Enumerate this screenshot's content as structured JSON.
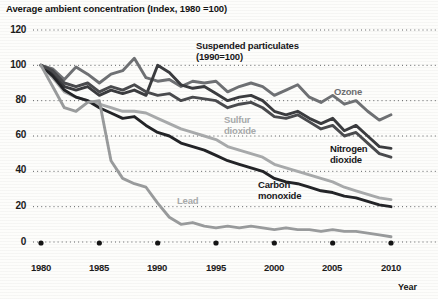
{
  "chart_data": {
    "type": "line",
    "title": "Average ambient concentration (Index, 1980 =100)",
    "xlabel": "Year",
    "ylabel": "",
    "xlim": [
      1980,
      2010
    ],
    "ylim": [
      0,
      120
    ],
    "grid": true,
    "grid_style": "dotted-horizontal",
    "legend": "inline-annotations",
    "xticks": [
      "1980",
      "1985",
      "1990",
      "1995",
      "2000",
      "2005",
      "2010"
    ],
    "yticks": [
      "0",
      "20",
      "40",
      "60",
      "80",
      "100",
      "120"
    ],
    "x": [
      1980,
      1981,
      1982,
      1983,
      1984,
      1985,
      1986,
      1987,
      1988,
      1989,
      1990,
      1991,
      1992,
      1993,
      1994,
      1995,
      1996,
      1997,
      1998,
      1999,
      2000,
      2001,
      2002,
      2003,
      2004,
      2005,
      2006,
      2007,
      2008,
      2009,
      2010
    ],
    "series": [
      {
        "name": "Ozone",
        "color": "#6f7174",
        "label_text": "Ozone",
        "values": [
          100,
          98,
          92,
          99,
          95,
          90,
          95,
          97,
          104,
          93,
          91,
          92,
          88,
          91,
          90,
          91,
          85,
          88,
          90,
          88,
          83,
          86,
          89,
          82,
          79,
          83,
          78,
          80,
          74,
          69,
          72
        ]
      },
      {
        "name": "Suspended particulates (1990=100)",
        "color": "#3b3c3f",
        "label_text": "Suspended particulates\n(1990=100)",
        "values": [
          100,
          96,
          88,
          86,
          88,
          83,
          86,
          84,
          86,
          83,
          100,
          96,
          89,
          87,
          88,
          84,
          80,
          82,
          83,
          80,
          74,
          72,
          74,
          70,
          67,
          70,
          63,
          66,
          60,
          54,
          53
        ]
      },
      {
        "name": "Sulfur dioxide",
        "color": "#a9abac",
        "label_text": "Sulfur\ndioxide",
        "values": [
          100,
          93,
          85,
          82,
          80,
          78,
          76,
          74,
          74,
          73,
          70,
          67,
          64,
          62,
          60,
          58,
          54,
          52,
          50,
          48,
          44,
          42,
          40,
          38,
          36,
          34,
          31,
          29,
          27,
          25,
          24
        ]
      },
      {
        "name": "Carbon monoxide",
        "color": "#232427",
        "label_text": "Carbon\nmonoxide",
        "values": [
          100,
          94,
          86,
          82,
          80,
          76,
          73,
          70,
          71,
          66,
          62,
          60,
          56,
          54,
          52,
          49,
          46,
          44,
          42,
          40,
          36,
          34,
          33,
          31,
          29,
          28,
          26,
          25,
          23,
          21,
          20
        ]
      },
      {
        "name": "Nitrogen dioxide",
        "color": "#4a4b4e",
        "label_text": "Nitrogen\ndioxide",
        "values": [
          100,
          97,
          90,
          88,
          90,
          85,
          88,
          86,
          89,
          85,
          83,
          84,
          80,
          82,
          81,
          80,
          76,
          78,
          79,
          76,
          71,
          70,
          72,
          68,
          64,
          66,
          60,
          62,
          56,
          50,
          48
        ]
      },
      {
        "name": "Lead",
        "color": "#9a9c9d",
        "label_text": "Lead",
        "values": [
          100,
          88,
          76,
          74,
          79,
          80,
          46,
          36,
          33,
          31,
          22,
          14,
          10,
          11,
          9,
          8,
          9,
          8,
          9,
          8,
          7,
          8,
          7,
          7,
          6,
          7,
          6,
          6,
          5,
          4,
          3
        ]
      }
    ]
  }
}
